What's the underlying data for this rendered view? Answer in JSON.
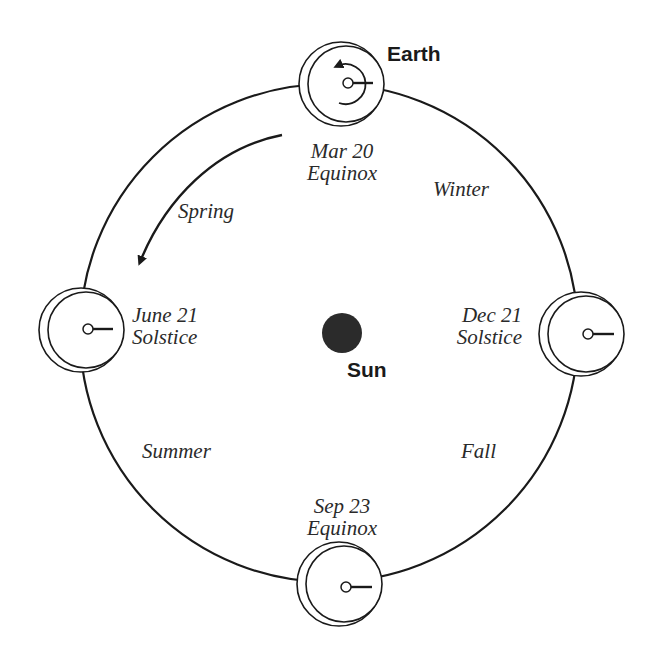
{
  "diagram": {
    "title_labels": {
      "earth": "Earth",
      "sun": "Sun"
    },
    "positions": [
      {
        "id": "mar",
        "date": "Mar 20",
        "event": "Equinox"
      },
      {
        "id": "jun",
        "date": "June 21",
        "event": "Solstice"
      },
      {
        "id": "sep",
        "date": "Sep 23",
        "event": "Equinox"
      },
      {
        "id": "dec",
        "date": "Dec 21",
        "event": "Solstice"
      }
    ],
    "seasons": {
      "spring": "Spring",
      "summer": "Summer",
      "fall": "Fall",
      "winter": "Winter"
    },
    "icons": {
      "orbit": "orbit-circle",
      "earth": "earth-disk",
      "sun": "sun-disk",
      "motion": "orbit-direction-arrow",
      "rotation": "rotation-arrow"
    },
    "colors": {
      "line": "#1a1a1a",
      "sun": "#2b2b2b",
      "text": "#2a2a2a",
      "background": "#ffffff"
    }
  }
}
